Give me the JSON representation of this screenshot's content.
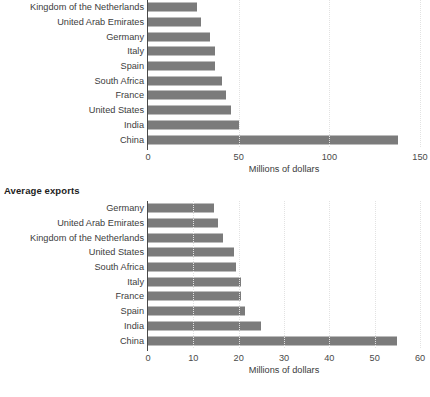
{
  "chart_data": [
    {
      "type": "bar",
      "orientation": "horizontal",
      "title": "",
      "xlabel": "Millions of dollars",
      "ylabel": "",
      "xlim": [
        0,
        150
      ],
      "xticks": [
        0,
        50,
        100,
        150
      ],
      "xtick_labels": [
        "0",
        "50",
        "100",
        "150"
      ],
      "grid": true,
      "legend": "none",
      "bar_color": "#7b7b7b",
      "categories": [
        "Kingdom of the Netherlands",
        "United Arab Emirates",
        "Germany",
        "Italy",
        "Spain",
        "South Africa",
        "France",
        "United States",
        "India",
        "China"
      ],
      "values": [
        27,
        29,
        34,
        37,
        37,
        41,
        43,
        46,
        50,
        138
      ]
    },
    {
      "type": "bar",
      "orientation": "horizontal",
      "title": "Average exports",
      "xlabel": "Millions of dollars",
      "ylabel": "",
      "xlim": [
        0,
        60
      ],
      "xticks": [
        0,
        10,
        20,
        30,
        40,
        50,
        60
      ],
      "xtick_labels": [
        "0",
        "10",
        "20",
        "30",
        "40",
        "50",
        "60"
      ],
      "grid": true,
      "legend": "none",
      "bar_color": "#7b7b7b",
      "categories": [
        "Germany",
        "United Arab Emirates",
        "Kingdom of the Netherlands",
        "United States",
        "South Africa",
        "Italy",
        "France",
        "Spain",
        "India",
        "China"
      ],
      "values": [
        14.5,
        15.5,
        16.5,
        19,
        19.5,
        20.5,
        20.5,
        21.5,
        25,
        55
      ]
    }
  ]
}
